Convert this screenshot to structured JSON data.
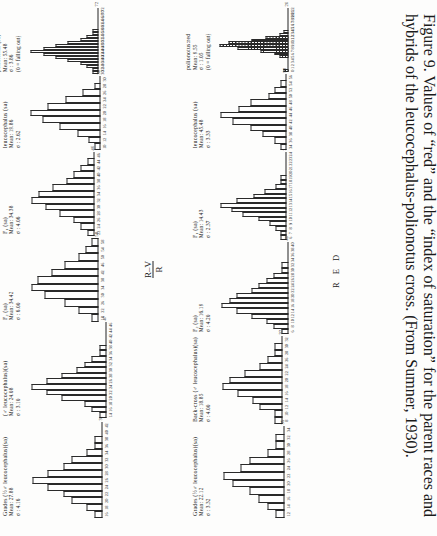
{
  "figure": {
    "number": "Figure 9.",
    "caption_part1": "Values of “red” and the “index of saturation” for the parent races and hybrids of the ",
    "caption_italic": "leucocephalus-polionotus",
    "caption_part2": " cross. (From ",
    "caption_source": "Sumner",
    "caption_part3": ", 1930)."
  },
  "axis_labels": {
    "red": "R E D",
    "saturation_num": "R–V",
    "saturation_den": "R"
  },
  "chart_data": {
    "type": "bar",
    "title": "Values of “red” and the “index of saturation” for the parent races and hybrids of the leucocephalus-polionotus cross",
    "panels": [
      {
        "id": "red-polionotus",
        "group": "RED",
        "name": "polionotus:red",
        "stats": [
          "Mean: 9.55",
          "σ : 1.05",
          "(0 = falling out)"
        ],
        "xlabel": "R E D",
        "categories": [
          "0",
          "1",
          "2",
          "3",
          "4",
          "5",
          "6",
          "7",
          "8",
          "9",
          "10",
          "11",
          "12",
          "13",
          "14",
          "15",
          "16",
          "17",
          "18",
          "19",
          "20",
          "21",
          "22"
        ],
        "values": [
          1,
          0,
          0,
          0,
          0,
          2,
          3,
          6,
          11,
          15,
          13,
          8,
          5,
          2,
          1,
          0,
          0,
          0,
          0,
          0,
          0,
          0,
          0
        ],
        "hatched_from": 0,
        "hatched_to": 12,
        "ymax": 16,
        "ytick": "26"
      },
      {
        "id": "red-f1",
        "group": "RED",
        "name": "F₁ (sa)",
        "stats": [
          "Mean: 14.43",
          "σ : 2.37"
        ],
        "categories": [
          "6",
          "7",
          "8",
          "9",
          "10",
          "11",
          "12",
          "13",
          "14",
          "15",
          "16",
          "17",
          "18",
          "19",
          "20",
          "21",
          "22",
          "23",
          "24"
        ],
        "values": [
          1,
          1,
          2,
          3,
          5,
          8,
          10,
          12,
          9,
          6,
          4,
          2,
          1,
          1,
          0,
          0,
          0,
          0,
          0
        ],
        "ymax": 13,
        "ytick": "237"
      },
      {
        "id": "red-f2",
        "group": "RED",
        "name": "F₂ (sa)",
        "stats": [
          "Mean: 16.19",
          "σ : 4.20"
        ],
        "categories": [
          "6",
          "8",
          "10",
          "12",
          "14",
          "16",
          "18",
          "20",
          "22",
          "24",
          "26",
          "28",
          "30",
          "32",
          "34",
          "36",
          "38",
          "40"
        ],
        "values": [
          1,
          2,
          3,
          5,
          7,
          9,
          8,
          7,
          5,
          4,
          3,
          2,
          1,
          1,
          0,
          0,
          0,
          0
        ],
        "ymax": 10,
        "ytick": "40"
      },
      {
        "id": "red-backcross",
        "group": "RED",
        "name": "Back-cross (♂ leucocephalus)(sa)",
        "stats": [
          "Mean: 18.85",
          "σ : 4.00"
        ],
        "categories": [
          "8",
          "10",
          "12",
          "14",
          "16",
          "18",
          "20",
          "22",
          "24",
          "26",
          "28",
          "30",
          "32"
        ],
        "values": [
          1,
          1,
          3,
          4,
          6,
          8,
          7,
          5,
          3,
          2,
          1,
          1,
          0
        ],
        "ymax": 9,
        "ytick": "32"
      },
      {
        "id": "red-grades",
        "group": "RED",
        "name": "Grades (½♂ leucocephalus)(sa)",
        "stats": [
          "Mean: 22.12",
          "σ : 3.32"
        ],
        "categories": [
          "12",
          "14",
          "16",
          "18",
          "20",
          "22",
          "24",
          "26",
          "28",
          "30",
          "32",
          "34"
        ],
        "values": [
          1,
          2,
          3,
          4,
          6,
          7,
          5,
          4,
          2,
          1,
          1,
          0
        ],
        "ymax": 8,
        "ytick": "35"
      },
      {
        "id": "red-leucocephalus",
        "group": "RED",
        "name": "leucocephalus (sa)",
        "stats": [
          "Mean: 45.48",
          "σ : 3.33"
        ],
        "categories": [
          "34",
          "36",
          "38",
          "40",
          "42",
          "44",
          "46",
          "48",
          "50",
          "52",
          "54",
          "56"
        ],
        "values": [
          1,
          2,
          4,
          6,
          9,
          11,
          8,
          6,
          3,
          2,
          1,
          0
        ],
        "ymax": 12,
        "ytick": "58"
      },
      {
        "id": "sat-polionotus",
        "group": "SATURATION",
        "name": "polionotus (sa)",
        "stats": [
          "Mean: 55.48",
          "σ : 3.86",
          "(0 = falling out)"
        ],
        "xlabel": "R–V / R",
        "categories": [
          "30",
          "32",
          "34",
          "36",
          "38",
          "40",
          "42",
          "44",
          "46",
          "48",
          "50",
          "52",
          "54",
          "56",
          "58",
          "60",
          "62",
          "64",
          "66",
          "68",
          "70",
          "72"
        ],
        "values": [
          1,
          1,
          2,
          3,
          5,
          7,
          9,
          11,
          9,
          7,
          5,
          3,
          2,
          1,
          1,
          0,
          0,
          0,
          0,
          0,
          0,
          0
        ],
        "ymax": 12,
        "ytick": "72"
      },
      {
        "id": "sat-leucocephalus",
        "group": "SATURATION",
        "name": "leucocephalus (sa)",
        "stats": [
          "Mean: 19.86",
          "σ : 2.62"
        ],
        "categories": [
          "10",
          "12",
          "14",
          "16",
          "18",
          "20",
          "22",
          "24",
          "26",
          "28",
          "30"
        ],
        "values": [
          1,
          2,
          4,
          7,
          10,
          12,
          9,
          6,
          3,
          1,
          0
        ],
        "ymax": 13,
        "ytick": "30"
      },
      {
        "id": "sat-f1",
        "group": "SATURATION",
        "name": "F₁ (sa)",
        "stats": [
          "Mean: 34.38",
          "σ : 4.06"
        ],
        "categories": [
          "22",
          "24",
          "26",
          "28",
          "30",
          "32",
          "34",
          "36",
          "38",
          "40",
          "42",
          "44",
          "46"
        ],
        "values": [
          1,
          2,
          3,
          5,
          7,
          9,
          8,
          6,
          4,
          3,
          2,
          1,
          0
        ],
        "ymax": 10,
        "ytick": "46"
      },
      {
        "id": "sat-f2",
        "group": "SATURATION",
        "name": "F₂ (sa)",
        "stats": [
          "Mean: 34.42",
          "σ : 6.00"
        ],
        "categories": [
          "18",
          "22",
          "26",
          "30",
          "34",
          "38",
          "42",
          "46",
          "50",
          "54",
          "58"
        ],
        "values": [
          1,
          3,
          5,
          8,
          10,
          9,
          7,
          5,
          3,
          2,
          1
        ],
        "ymax": 11,
        "ytick": "58"
      },
      {
        "id": "sat-grades-male",
        "group": "SATURATION",
        "name": "(♂ leucocephalus)(sa)",
        "stats": [
          "Mean: 24.08",
          "σ : 3.10"
        ],
        "categories": [
          "14",
          "16",
          "18",
          "20",
          "22",
          "24",
          "26",
          "28",
          "30",
          "32",
          "34",
          "36",
          "38",
          "40",
          "42",
          "44",
          "46"
        ],
        "values": [
          1,
          2,
          3,
          6,
          8,
          10,
          8,
          6,
          4,
          3,
          2,
          1,
          1,
          0,
          0,
          0,
          0
        ],
        "ymax": 11,
        "ytick": "47"
      },
      {
        "id": "sat-grades",
        "group": "SATURATION",
        "name": "Grades (½♂ leucocephalus)(sa)",
        "stats": [
          "Mean: 27.88",
          "σ : 4.16"
        ],
        "categories": [
          "16",
          "18",
          "20",
          "22",
          "24",
          "26",
          "28",
          "30",
          "32",
          "34",
          "36",
          "38",
          "40",
          "42"
        ],
        "values": [
          1,
          2,
          4,
          5,
          7,
          9,
          7,
          5,
          4,
          2,
          1,
          1,
          0,
          0
        ],
        "ymax": 10,
        "ytick": "31"
      }
    ]
  }
}
